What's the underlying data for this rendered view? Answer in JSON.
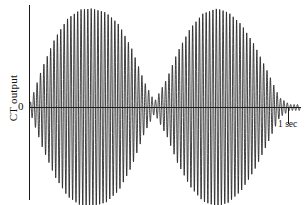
{
  "figure": {
    "background_color": "#ffffff",
    "ink_color": "#202020"
  },
  "labels": {
    "y_axis": "CT output",
    "zero_tick": "0",
    "scale_marker": "1 sec"
  },
  "chart_data": {
    "type": "line",
    "title": "",
    "subtitle": "",
    "xlabel": "",
    "ylabel": "CT output",
    "legend": [],
    "legend_position": "none",
    "grid": false,
    "xlim": [
      0,
      1.06
    ],
    "ylim": [
      -1.05,
      1.05
    ],
    "x_tick_labels": [
      "1 sec"
    ],
    "x_tick_values": [
      0.96
    ],
    "y_tick_labels": [
      "0"
    ],
    "y_tick_values": [
      0
    ],
    "annotations": [
      {
        "text": "1 sec",
        "x": 0.96,
        "y": -0.22,
        "role": "time-scale-marker"
      }
    ],
    "waveform": {
      "model": "beat",
      "carrier_cycles": 80,
      "carrier_frequency_hz": 80,
      "beat_frequency_hz": 2,
      "envelope_lobes": 2,
      "envelope_node_x": 0.49,
      "start_amplitude": 0.03,
      "end_amplitude": 0.03,
      "peak_amplitude": 1.0,
      "peak_positions_x": [
        0.245,
        0.735
      ],
      "samples_per_pixel": 14
    },
    "series": [
      {
        "name": "CT output",
        "color": "#202020",
        "envelope_x": [
          0.0,
          0.05,
          0.1,
          0.15,
          0.2,
          0.245,
          0.3,
          0.35,
          0.4,
          0.45,
          0.49,
          0.54,
          0.58,
          0.63,
          0.68,
          0.735,
          0.78,
          0.83,
          0.88,
          0.93,
          0.98,
          1.02
        ],
        "envelope_y": [
          0.03,
          0.4,
          0.7,
          0.9,
          0.99,
          1.0,
          0.96,
          0.84,
          0.6,
          0.26,
          0.06,
          0.3,
          0.56,
          0.8,
          0.95,
          1.0,
          0.96,
          0.84,
          0.64,
          0.38,
          0.1,
          0.03
        ]
      }
    ]
  }
}
